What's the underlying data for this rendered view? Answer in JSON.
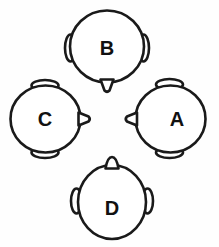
{
  "diagram": {
    "background_color": "#fefefe",
    "stroke_color": "#1a1a1a",
    "fill_color": "#ffffff",
    "label_color": "#111111",
    "heads": [
      {
        "label": "A",
        "position": "right",
        "facing": "left",
        "nose_direction": "left",
        "ear_positions": "top-and-bottom",
        "label_x": 177,
        "label_y": 119
      },
      {
        "label": "B",
        "position": "top",
        "facing": "down",
        "nose_direction": "down",
        "ear_positions": "left-and-right",
        "label_x": 107,
        "label_y": 48
      },
      {
        "label": "C",
        "position": "left",
        "facing": "right",
        "nose_direction": "right",
        "ear_positions": "top-and-bottom",
        "label_x": 45,
        "label_y": 119
      },
      {
        "label": "D",
        "position": "bottom",
        "facing": "up",
        "nose_direction": "up",
        "ear_positions": "left-and-right",
        "label_x": 112,
        "label_y": 208
      }
    ]
  }
}
